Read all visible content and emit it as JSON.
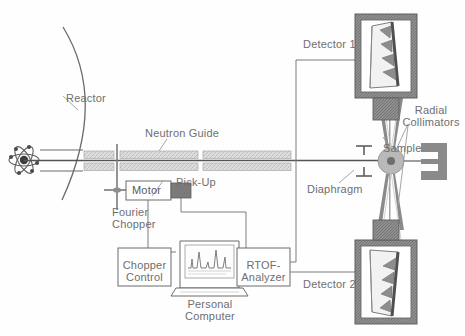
{
  "diagram": {
    "labels": {
      "reactor": "Reactor",
      "neutron_guide": "Neutron Guide",
      "pick_up": "Pick-Up",
      "motor": "Motor",
      "fourier_chopper": "Fourier\nChopper",
      "chopper_control": "Chopper\nControl",
      "personal_computer": "Personal\nComputer",
      "rtof_analyzer": "RTOF-\nAnalyzer",
      "detector_1": "Detector 1",
      "detector_2": "Detector 2",
      "diaphragm": "Diaphragm",
      "sample": "Sample",
      "radial_collimators": "Radial\nCollimators"
    },
    "components": [
      {
        "name": "reactor-core",
        "type": "atom-symbol"
      },
      {
        "name": "reactor-wall",
        "type": "arc"
      },
      {
        "name": "neutron-guide",
        "type": "segmented-bars",
        "segments": 4
      },
      {
        "name": "fourier-chopper",
        "type": "cross-disc"
      },
      {
        "name": "motor",
        "type": "box"
      },
      {
        "name": "pick-up",
        "type": "block"
      },
      {
        "name": "chopper-control",
        "type": "box"
      },
      {
        "name": "personal-computer",
        "type": "laptop"
      },
      {
        "name": "rtof-analyzer",
        "type": "box"
      },
      {
        "name": "diaphragm",
        "type": "slit"
      },
      {
        "name": "sample",
        "type": "disc"
      },
      {
        "name": "radial-collimators",
        "type": "blades"
      },
      {
        "name": "beam-stop",
        "type": "bracket"
      },
      {
        "name": "detector-1",
        "type": "shielded-detector"
      },
      {
        "name": "detector-2",
        "type": "shielded-detector"
      }
    ],
    "colors": {
      "line": "#6b6b6b",
      "text": "#6e6e6e",
      "guide_fill": "#d9d9d9",
      "shield": "#8a8a8a",
      "dark_block": "#707070",
      "sample_fill": "#b9b9b9"
    }
  }
}
